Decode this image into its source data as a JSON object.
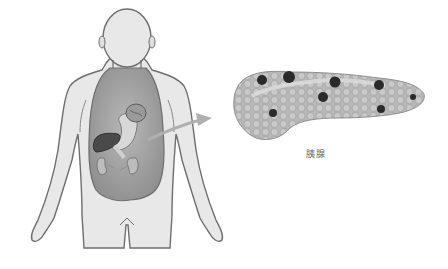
{
  "diagram": {
    "title": "",
    "figure": "human-body-torso-organs",
    "organs_shown": [
      "stomach",
      "liver",
      "gallbladder",
      "kidneys",
      "pancreas"
    ],
    "arrow": {
      "from": "pancreas-in-body",
      "to": "pancreas-enlarged"
    },
    "pancreas_label": "胰腺",
    "colors": {
      "outline": "#6e6e6e",
      "skin": "#e6e6e6",
      "cavity": "#a9a9a9",
      "liver": "#4a4a4a",
      "pancreas": "#b5b5b5",
      "lesion": "#2a2a2a"
    },
    "lesions": [
      {
        "cx": 262,
        "cy": 80,
        "r": 5
      },
      {
        "cx": 289,
        "cy": 77,
        "r": 6
      },
      {
        "cx": 335,
        "cy": 82,
        "r": 5.5
      },
      {
        "cx": 379,
        "cy": 85,
        "r": 5
      },
      {
        "cx": 323,
        "cy": 97,
        "r": 5
      },
      {
        "cx": 273,
        "cy": 113,
        "r": 4
      },
      {
        "cx": 381,
        "cy": 109,
        "r": 4
      },
      {
        "cx": 413,
        "cy": 97,
        "r": 3
      }
    ]
  }
}
